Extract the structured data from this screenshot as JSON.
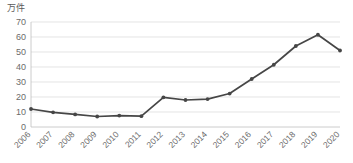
{
  "chart_data": {
    "type": "line",
    "title": "",
    "subtitle": "",
    "xlabel": "",
    "ylabel": "万件",
    "unit_label": "万件",
    "categories": [
      "2006",
      "2007",
      "2008",
      "2009",
      "2010",
      "2011",
      "2012",
      "2013",
      "2014",
      "2015",
      "2016",
      "2017",
      "2018",
      "2019",
      "2020"
    ],
    "values": [
      12.0,
      9.8,
      8.4,
      7.0,
      7.6,
      7.2,
      19.8,
      18.0,
      18.6,
      22.3,
      32.0,
      41.5,
      54.0,
      61.5,
      51.0
    ],
    "series": [
      {
        "name": "件数",
        "values": [
          12.0,
          9.8,
          8.4,
          7.0,
          7.6,
          7.2,
          19.8,
          18.0,
          18.6,
          22.3,
          32.0,
          41.5,
          54.0,
          61.5,
          51.0
        ]
      }
    ],
    "ylim": [
      0,
      70
    ],
    "yticks": [
      0,
      10,
      20,
      30,
      40,
      50,
      60,
      70
    ],
    "ytick_labels": [
      "0",
      "10",
      "20",
      "30",
      "40",
      "50",
      "60",
      "70"
    ],
    "xtick_labels": [
      "2006",
      "2007",
      "2008",
      "2009",
      "2010",
      "2011",
      "2012",
      "2013",
      "2014",
      "2015",
      "2016",
      "2017",
      "2018",
      "2019",
      "2020"
    ],
    "xtick_rotation_deg": -45,
    "grid": true,
    "grid_axis": "y",
    "legend": false,
    "legend_position": "none",
    "markers": true,
    "annotations": [],
    "colors": {
      "line": "#464646",
      "marker": "#464646",
      "grid": "#d9d9d9",
      "axis": "#bfbfbf",
      "text": "#6b6b6b",
      "background": "#ffffff"
    }
  }
}
